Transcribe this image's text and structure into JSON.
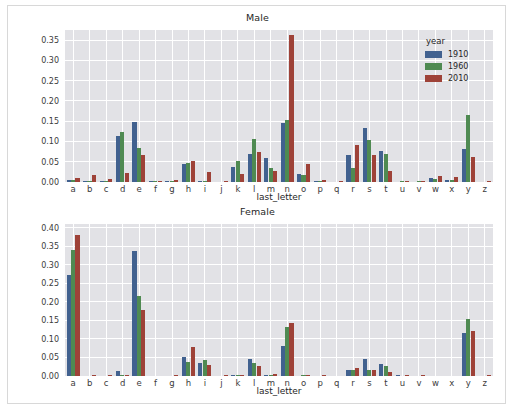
{
  "figure": {
    "background": "#ffffff",
    "axes_background": "#e2e2e6",
    "grid_color": "#ffffff"
  },
  "legend": {
    "title": "year",
    "entries": [
      {
        "label": "1910",
        "color": "#41618f"
      },
      {
        "label": "1960",
        "color": "#4f8a52"
      },
      {
        "label": "2010",
        "color": "#9e4238"
      }
    ]
  },
  "chart_data": [
    {
      "type": "bar",
      "title": "Male",
      "xlabel": "last_letter",
      "ylabel": "",
      "ylim": [
        0.0,
        0.375
      ],
      "yticks": [
        0.0,
        0.05,
        0.1,
        0.15,
        0.2,
        0.25,
        0.3,
        0.35
      ],
      "ytick_labels": [
        "0.00",
        "0.05",
        "0.10",
        "0.15",
        "0.20",
        "0.25",
        "0.30",
        "0.35"
      ],
      "grid": true,
      "legend_position": "upper right",
      "categories": [
        "a",
        "b",
        "c",
        "d",
        "e",
        "f",
        "g",
        "h",
        "i",
        "j",
        "k",
        "l",
        "m",
        "n",
        "o",
        "p",
        "q",
        "r",
        "s",
        "t",
        "u",
        "v",
        "w",
        "x",
        "y",
        "z"
      ],
      "series": [
        {
          "name": "1910",
          "color": "#41618f",
          "values": [
            0.005,
            0.002,
            0.002,
            0.113,
            0.148,
            0.002,
            0.002,
            0.044,
            0.001,
            0.0,
            0.038,
            0.068,
            0.06,
            0.146,
            0.02,
            0.002,
            0.0,
            0.067,
            0.134,
            0.076,
            0.0,
            0.0,
            0.009,
            0.006,
            0.082,
            0.0
          ]
        },
        {
          "name": "1960",
          "color": "#4f8a52",
          "values": [
            0.005,
            0.002,
            0.002,
            0.123,
            0.085,
            0.002,
            0.002,
            0.048,
            0.001,
            0.0,
            0.051,
            0.106,
            0.034,
            0.152,
            0.018,
            0.002,
            0.0,
            0.035,
            0.104,
            0.07,
            0.001,
            0.001,
            0.008,
            0.004,
            0.165,
            0.0
          ]
        },
        {
          "name": "2010",
          "color": "#9e4238",
          "values": [
            0.011,
            0.018,
            0.007,
            0.023,
            0.067,
            0.003,
            0.004,
            0.053,
            0.025,
            0.001,
            0.02,
            0.073,
            0.027,
            0.363,
            0.045,
            0.004,
            0.001,
            0.091,
            0.067,
            0.026,
            0.002,
            0.003,
            0.015,
            0.013,
            0.062,
            0.001
          ]
        }
      ]
    },
    {
      "type": "bar",
      "title": "Female",
      "xlabel": "last_letter",
      "ylabel": "",
      "ylim": [
        0.0,
        0.41
      ],
      "yticks": [
        0.0,
        0.05,
        0.1,
        0.15,
        0.2,
        0.25,
        0.3,
        0.35,
        0.4
      ],
      "ytick_labels": [
        "0.00",
        "0.05",
        "0.10",
        "0.15",
        "0.20",
        "0.25",
        "0.30",
        "0.35",
        "0.40"
      ],
      "grid": true,
      "legend_position": "none",
      "categories": [
        "a",
        "b",
        "c",
        "d",
        "e",
        "f",
        "g",
        "h",
        "i",
        "j",
        "k",
        "l",
        "m",
        "n",
        "o",
        "p",
        "q",
        "r",
        "s",
        "t",
        "u",
        "v",
        "w",
        "x",
        "y",
        "z"
      ],
      "series": [
        {
          "name": "1910",
          "color": "#41618f",
          "values": [
            0.272,
            0.0,
            0.0,
            0.014,
            0.338,
            0.0,
            0.0,
            0.052,
            0.036,
            0.0,
            0.002,
            0.046,
            0.001,
            0.082,
            0.0,
            0.0,
            0.0,
            0.016,
            0.045,
            0.032,
            0.001,
            0.0,
            0.0,
            0.0,
            0.115,
            0.0
          ]
        },
        {
          "name": "1960",
          "color": "#4f8a52",
          "values": [
            0.341,
            0.0,
            0.0,
            0.002,
            0.216,
            0.0,
            0.0,
            0.038,
            0.043,
            0.0,
            0.002,
            0.034,
            0.001,
            0.131,
            0.002,
            0.0,
            0.0,
            0.016,
            0.017,
            0.028,
            0.0,
            0.0,
            0.0,
            0.0,
            0.155,
            0.0
          ]
        },
        {
          "name": "2010",
          "color": "#9e4238",
          "values": [
            0.381,
            0.001,
            0.001,
            0.001,
            0.178,
            0.0,
            0.001,
            0.078,
            0.031,
            0.001,
            0.003,
            0.027,
            0.005,
            0.143,
            0.003,
            0.001,
            0.0,
            0.022,
            0.017,
            0.012,
            0.001,
            0.001,
            0.0,
            0.0,
            0.122,
            0.001
          ]
        }
      ]
    }
  ]
}
